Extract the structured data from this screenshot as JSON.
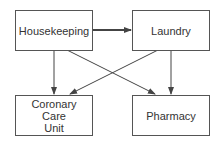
{
  "diagram": {
    "nodes": [
      {
        "id": "housekeeping",
        "label": "Housekeeping"
      },
      {
        "id": "laundry",
        "label": "Laundry"
      },
      {
        "id": "ccu",
        "label": "Coronary\nCare\nUnit"
      },
      {
        "id": "pharmacy",
        "label": "Pharmacy"
      }
    ],
    "edges": [
      {
        "from": "housekeeping",
        "to": "laundry",
        "style": "thick"
      },
      {
        "from": "housekeeping",
        "to": "ccu",
        "style": "normal"
      },
      {
        "from": "housekeeping",
        "to": "pharmacy",
        "style": "normal"
      },
      {
        "from": "laundry",
        "to": "ccu",
        "style": "normal"
      },
      {
        "from": "laundry",
        "to": "pharmacy",
        "style": "normal"
      }
    ],
    "colors": {
      "line": "#444444",
      "border": "#555555",
      "text": "#333333"
    }
  }
}
